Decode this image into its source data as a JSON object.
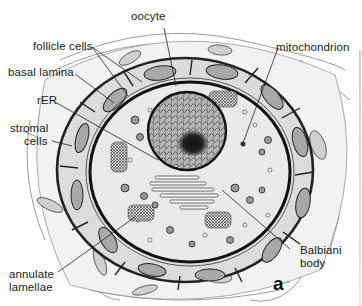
{
  "figure": {
    "panel_letter": "a",
    "labels": [
      {
        "id": "oocyte",
        "text": "oocyte"
      },
      {
        "id": "follicle_cells",
        "text": "follicle cells"
      },
      {
        "id": "basal_lamina",
        "text": "basal lamina"
      },
      {
        "id": "rer",
        "text": "rER"
      },
      {
        "id": "stromal_cells",
        "text": "stromal cells",
        "lines": [
          "stromal",
          "cells"
        ]
      },
      {
        "id": "mitochondrion",
        "text": "mitochondrion"
      },
      {
        "id": "annulate_lamellae",
        "text": "annulate lamellae",
        "lines": [
          "annulate",
          "lamellae"
        ]
      },
      {
        "id": "balbiani_body",
        "text": "Balbiani body",
        "lines": [
          "Balbiani",
          "body"
        ]
      }
    ],
    "colors": {
      "ink": "#1a1a1a",
      "cytoplasm": "#e9e9e9",
      "follicle_layer": "#dcdcdc",
      "nucleus": "#9a9a9a",
      "stroma": "#f2f2f2"
    }
  }
}
